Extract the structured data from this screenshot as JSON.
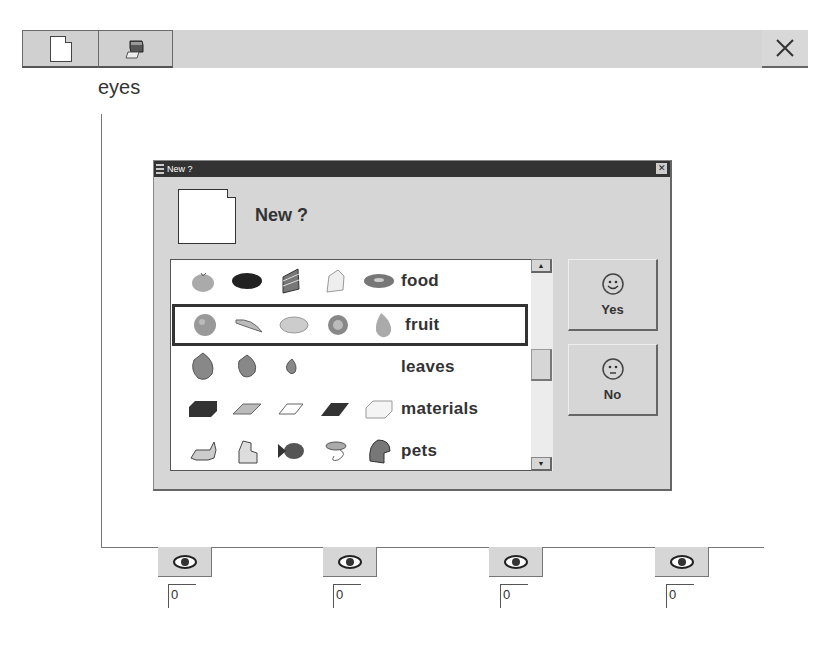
{
  "toolbar": {
    "buttons": [
      {
        "name": "new",
        "icon": "new-document-icon"
      },
      {
        "name": "print",
        "icon": "printer-icon"
      }
    ],
    "close_icon": "close-icon",
    "close_glyph": "✕"
  },
  "page": {
    "label": "eyes"
  },
  "dialog": {
    "title": "New ?",
    "close_glyph": "✕",
    "heading": "New ?",
    "icon": "new-document-icon",
    "list": [
      {
        "label": "food",
        "icons": [
          "apple-icon",
          "cookie-icon",
          "cake-slice-icon",
          "cheese-icon",
          "donut-icon"
        ],
        "selected": false
      },
      {
        "label": "fruit",
        "icons": [
          "orange-icon",
          "banana-icon",
          "grapes-icon",
          "kiwi-icon",
          "pear-icon"
        ],
        "selected": true
      },
      {
        "label": "leaves",
        "icons": [
          "large-leaf-icon",
          "medium-leaf-icon",
          "small-leaf-icon"
        ],
        "selected": false
      },
      {
        "label": "materials",
        "icons": [
          "dark-block-icon",
          "light-slab-icon",
          "white-slab-icon",
          "black-slab-icon",
          "white-block-icon"
        ],
        "selected": false
      },
      {
        "label": "pets",
        "icons": [
          "cat-icon",
          "dog-icon",
          "fish-icon",
          "mouse-icon",
          "parrot-icon"
        ],
        "selected": false
      }
    ],
    "scroll_up_glyph": "▲",
    "scroll_down_glyph": "▼",
    "buttons": {
      "yes": {
        "label": "Yes",
        "icon": "happy-face-icon"
      },
      "no": {
        "label": "No",
        "icon": "neutral-face-icon"
      }
    }
  },
  "eye_panels": [
    {
      "icon": "eye-icon",
      "value": "0"
    },
    {
      "icon": "eye-icon",
      "value": "0"
    },
    {
      "icon": "eye-icon",
      "value": "0"
    },
    {
      "icon": "eye-icon",
      "value": "0"
    }
  ]
}
